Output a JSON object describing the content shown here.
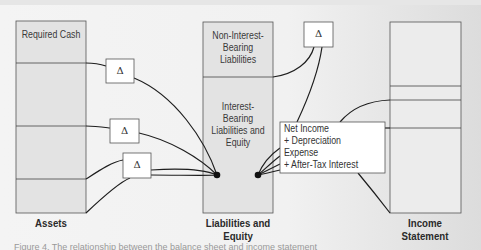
{
  "diagram": {
    "columns": [
      {
        "id": "assets",
        "caption": "Assets",
        "sections": [
          {
            "label": "Required Cash"
          },
          {
            "label": ""
          },
          {
            "label": ""
          },
          {
            "label": ""
          }
        ]
      },
      {
        "id": "liabilities-equity",
        "caption_line1": "Liabilities and",
        "caption_line2": "Equity",
        "sections": [
          {
            "label_lines": [
              "Non-Interest-",
              "Bearing",
              "Liabilities"
            ]
          },
          {
            "label_lines": [
              "Interest-",
              "Bearing",
              "Liabilities and",
              "Equity"
            ]
          }
        ]
      },
      {
        "id": "income-statement",
        "caption_line1": "Income",
        "caption_line2": "Statement",
        "sections": [
          {
            "label": ""
          },
          {
            "label": ""
          },
          {
            "label": ""
          },
          {
            "label": ""
          }
        ]
      }
    ],
    "delta_symbol": "Δ",
    "delta_boxes": [
      {
        "id": "delta-top",
        "label": "Δ"
      },
      {
        "id": "delta-assets-1",
        "label": "Δ"
      },
      {
        "id": "delta-assets-2",
        "label": "Δ"
      },
      {
        "id": "delta-assets-3",
        "label": "Δ"
      }
    ],
    "cash_flow_box": {
      "lines": [
        "Net Income",
        "+ Depreciation",
        "Expense",
        "+ After-Tax Interest"
      ]
    },
    "colors": {
      "box_fill": "#e3e3e3",
      "income_fill": "#ececec",
      "stroke": "#555555",
      "line": "#1e1e1e"
    }
  },
  "footnote": "Figure 4. The relationship between the balance sheet and income statement"
}
